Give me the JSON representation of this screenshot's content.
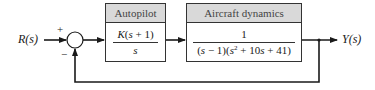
{
  "diagram": {
    "type": "closed-loop-block-diagram",
    "input_label": "R(s)",
    "output_label": "Y(s)",
    "summing_junction": {
      "plus_sign": "+",
      "minus_sign": "−"
    },
    "blocks": [
      {
        "title": "Autopilot",
        "numerator": "K(s + 1)",
        "denominator": "s"
      },
      {
        "title": "Aircraft dynamics",
        "numerator": "1",
        "denominator": "(s − 1)(s² + 10s + 41)"
      }
    ],
    "feedback": "unity negative feedback from Y(s) to summing junction",
    "colors": {
      "line": "#1a1a1a",
      "header_fill": "#d9d9d9",
      "border": "#333333"
    }
  }
}
